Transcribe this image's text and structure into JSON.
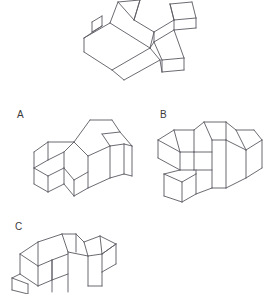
{
  "page": {
    "kind": "spatial-reasoning-question",
    "background_color": "#ffffff",
    "line_color": "#5a5a62",
    "text_color": "#3a3a3a"
  },
  "target": {
    "name": "target-figure",
    "description": "Isometric wireframe of a plus/cross shaped block assembly viewed from above-left"
  },
  "options": [
    {
      "label": "A",
      "name": "option-a",
      "description": "Isometric wireframe block figure, answer choice A"
    },
    {
      "label": "B",
      "name": "option-b",
      "description": "Isometric wireframe block figure, answer choice B"
    },
    {
      "label": "C",
      "name": "option-c",
      "description": "Isometric wireframe block figure, answer choice C, clipped at bottom edge"
    }
  ]
}
